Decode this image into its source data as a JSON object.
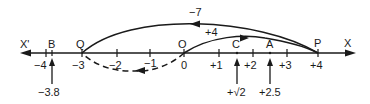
{
  "diagram": {
    "axis": {
      "left_label": "X'",
      "right_label": "X",
      "ticks": [
        {
          "value": -4,
          "label": "−4",
          "x": 46
        },
        {
          "value": -3,
          "label": "−3",
          "x": 82
        },
        {
          "value": -2,
          "label": "−2",
          "x": 117
        },
        {
          "value": -1,
          "label": "−1",
          "x": 150
        },
        {
          "value": 0,
          "label": "0",
          "x": 184
        },
        {
          "value": 1,
          "label": "+1",
          "x": 219
        },
        {
          "value": 2,
          "label": "+2",
          "x": 253
        },
        {
          "value": 3,
          "label": "+3",
          "x": 287
        },
        {
          "value": 4,
          "label": "+4",
          "x": 318
        }
      ]
    },
    "points": [
      {
        "name": "B",
        "value": -3.8,
        "pointer_label": "−3.8"
      },
      {
        "name": "Q",
        "value": -3
      },
      {
        "name": "O",
        "value": 0
      },
      {
        "name": "C",
        "value": 1.414,
        "pointer_label": "+√2"
      },
      {
        "name": "A",
        "value": 2.5,
        "pointer_label": "+2.5"
      },
      {
        "name": "P",
        "value": 4
      }
    ],
    "arcs": [
      {
        "from": "P",
        "to": "Q",
        "label": "−7",
        "style": "solid"
      },
      {
        "from": "O",
        "to": "P",
        "label": "+4",
        "style": "solid"
      },
      {
        "from": "O",
        "to": "Q",
        "label": "",
        "style": "dashed"
      }
    ],
    "colors": {
      "ink": "#1a1a1a",
      "background": "#ffffff"
    }
  }
}
